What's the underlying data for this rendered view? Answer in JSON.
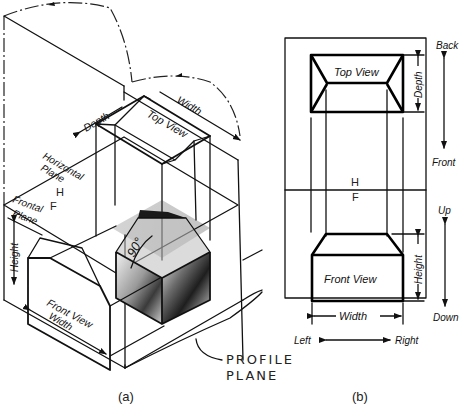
{
  "figure": {
    "panel_a": {
      "caption": "(a)",
      "labels": {
        "depth": "Depth",
        "width_top": "Width",
        "top_view": "Top View",
        "horizontal_plane_1": "Horizontal",
        "horizontal_plane_2": "Plane",
        "h_mark": "H",
        "f_mark": "F",
        "frontal_plane_1": "Frontal",
        "frontal_plane_2": "Plane",
        "height": "Height",
        "front_view": "Front View",
        "width_bottom": "Width",
        "angle": "90°",
        "profile_plane_1": "PROFILE",
        "profile_plane_2": "PLANE"
      }
    },
    "panel_b": {
      "caption": "(b)",
      "labels": {
        "back": "Back",
        "front": "Front",
        "up": "Up",
        "down": "Down",
        "left": "Left",
        "right": "Right",
        "top_view": "Top View",
        "depth": "Depth",
        "h_mark": "H",
        "f_mark": "F",
        "front_view": "Front View",
        "height": "Height",
        "width": "Width"
      }
    },
    "colors": {
      "line": "#111111",
      "background": "#ffffff",
      "shade_dark": "#2a2a2a",
      "shade_light": "#d8d8d8"
    }
  }
}
